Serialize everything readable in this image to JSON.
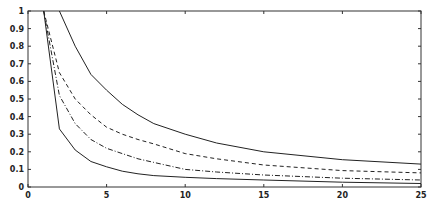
{
  "chart_data": {
    "type": "line",
    "title": "",
    "xlabel": "",
    "ylabel": "",
    "xlim": [
      0,
      25
    ],
    "ylim": [
      0,
      1
    ],
    "grid": false,
    "legend": null,
    "x_ticks": [
      "0",
      "5",
      "10",
      "15",
      "20",
      "25"
    ],
    "y_ticks": [
      "0",
      "0.1",
      "0.2",
      "0.3",
      "0.4",
      "0.5",
      "0.6",
      "0.7",
      "0.8",
      "0.9",
      "1"
    ],
    "series": [
      {
        "name": "solid-upper",
        "style": "solid",
        "x": [
          2,
          3,
          4,
          5,
          6,
          7,
          8,
          10,
          12,
          15,
          20,
          25
        ],
        "y": [
          1.0,
          0.8,
          0.64,
          0.55,
          0.47,
          0.41,
          0.36,
          0.3,
          0.25,
          0.2,
          0.155,
          0.13
        ]
      },
      {
        "name": "dashed",
        "style": "dashed",
        "x": [
          1,
          2,
          3,
          4,
          5,
          6,
          7,
          8,
          10,
          12,
          15,
          20,
          25
        ],
        "y": [
          1.0,
          0.65,
          0.5,
          0.41,
          0.34,
          0.3,
          0.27,
          0.245,
          0.19,
          0.16,
          0.125,
          0.093,
          0.08
        ]
      },
      {
        "name": "dash-dot",
        "style": "dashdot",
        "x": [
          1,
          2,
          3,
          4,
          5,
          6,
          7,
          8,
          10,
          12,
          15,
          20,
          25
        ],
        "y": [
          1.0,
          0.52,
          0.36,
          0.27,
          0.22,
          0.19,
          0.16,
          0.14,
          0.1,
          0.085,
          0.068,
          0.05,
          0.04
        ]
      },
      {
        "name": "solid-lower",
        "style": "solid",
        "x": [
          1,
          2,
          3,
          4,
          5,
          6,
          7,
          8,
          10,
          12,
          15,
          20,
          25
        ],
        "y": [
          1.0,
          0.33,
          0.21,
          0.145,
          0.115,
          0.09,
          0.075,
          0.065,
          0.055,
          0.048,
          0.04,
          0.027,
          0.02
        ]
      }
    ]
  }
}
